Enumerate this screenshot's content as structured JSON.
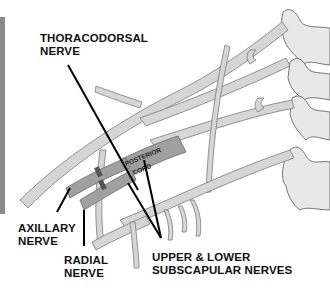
{
  "figure": {
    "colors": {
      "background": "#ffffff",
      "nerve_fill": "#d6d6d6",
      "nerve_outline": "#7a7a7a",
      "posterior_cord_fill": "#9e9e9e",
      "vertebra_fill": "#e8e8e8",
      "leader_line": "#000000",
      "side_bar": "#8a8a8a"
    }
  },
  "labels": {
    "thoracodorsal": {
      "line1": "THORACODORSAL",
      "line2": "NERVE"
    },
    "axillary": {
      "line1": "AXILLARY",
      "line2": "NERVE"
    },
    "radial": {
      "line1": "RADIAL",
      "line2": "NERVE"
    },
    "subscapular": {
      "line1": "UPPER & LOWER",
      "line2": "SUBSCAPULAR NERVES"
    },
    "posterior_cord": {
      "line1": "POSTERIOR",
      "line2": "CORD"
    }
  }
}
